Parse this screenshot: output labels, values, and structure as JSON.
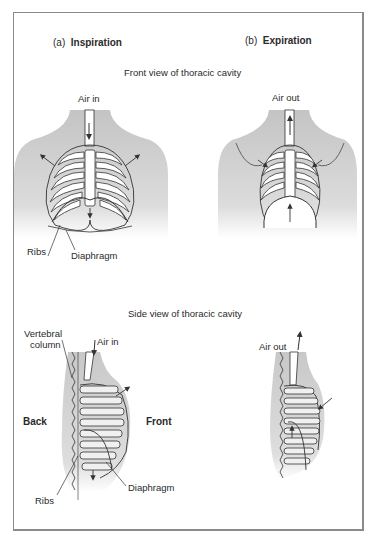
{
  "panels": {
    "a": {
      "prefix": "(a)",
      "title": "Inspiration"
    },
    "b": {
      "prefix": "(b)",
      "title": "Expiration"
    }
  },
  "sections": {
    "front": "Front view of thoracic cavity",
    "side": "Side view of thoracic cavity"
  },
  "labels": {
    "front_inspiration": {
      "air": "Air in",
      "ribs": "Ribs",
      "diaphragm": "Diaphragm"
    },
    "front_expiration": {
      "air": "Air out"
    },
    "side_inspiration": {
      "air": "Air in",
      "vertebral_line1": "Vertebral",
      "vertebral_line2": "column",
      "back": "Back",
      "front": "Front",
      "ribs": "Ribs",
      "diaphragm": "Diaphragm"
    },
    "side_expiration": {
      "air": "Air out"
    }
  },
  "colors": {
    "shade": "#c9c9c9",
    "line": "#333333",
    "bone": "#ffffff"
  }
}
